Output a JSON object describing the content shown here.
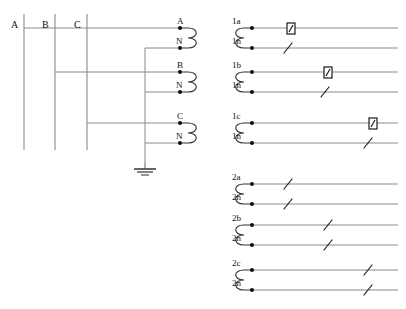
{
  "diagram": {
    "colors": {
      "line": "#8a8a8a",
      "dark_line": "#202020",
      "terminal_dot": "#101010",
      "text": "#101010",
      "background": "#ffffff"
    },
    "bus_labels": [
      {
        "name": "bus-label-a",
        "text": "A",
        "x": 12,
        "y": 28
      },
      {
        "name": "bus-label-b",
        "text": "B",
        "x": 43,
        "y": 28
      },
      {
        "name": "bus-label-c",
        "text": "C",
        "x": 74,
        "y": 28
      }
    ],
    "bus_bars": [
      {
        "name": "bus-bar-a",
        "phase": "A",
        "x": 24,
        "y_top": 14,
        "y_bottom": 150
      },
      {
        "name": "bus-bar-b",
        "phase": "B",
        "x": 55,
        "y_top": 14,
        "y_bottom": 150
      },
      {
        "name": "bus-bar-c",
        "phase": "C",
        "x": 87,
        "y_top": 14,
        "y_bottom": 150
      }
    ],
    "primary_taps": [
      {
        "name": "tap-a",
        "phase": "A",
        "from_x": 24,
        "y": 28,
        "to_x": 180
      },
      {
        "name": "tap-b",
        "phase": "B",
        "from_x": 55,
        "y": 72,
        "to_x": 180
      },
      {
        "name": "tap-c",
        "phase": "C",
        "from_x": 87,
        "y": 123,
        "to_x": 180
      }
    ],
    "neutral_bus": {
      "name": "neutral-bus",
      "x": 145,
      "y_top": 48,
      "y_bottom": 163,
      "taps": [
        {
          "name": "neutral-tap-1",
          "y": 48,
          "to_x": 180
        },
        {
          "name": "neutral-tap-2",
          "y": 92,
          "to_x": 180
        },
        {
          "name": "neutral-tap-3",
          "y": 143,
          "to_x": 180
        }
      ]
    },
    "ground": {
      "name": "ground-symbol",
      "x": 145,
      "y": 163,
      "label": "earth-ground"
    },
    "primary_windings": [
      {
        "name": "primary-winding-a",
        "x": 182,
        "y_top": 28,
        "y_bottom": 48
      },
      {
        "name": "primary-winding-b",
        "x": 182,
        "y_top": 72,
        "y_bottom": 92
      },
      {
        "name": "primary-winding-c",
        "x": 182,
        "y_top": 123,
        "y_bottom": 143
      }
    ],
    "primary_terminals": [
      {
        "name": "terminal-a",
        "label": "A",
        "x": 180,
        "y": 28
      },
      {
        "name": "terminal-n-1",
        "label": "N",
        "x": 180,
        "y": 48
      },
      {
        "name": "terminal-b",
        "label": "B",
        "x": 180,
        "y": 72
      },
      {
        "name": "terminal-n-2",
        "label": "N",
        "x": 180,
        "y": 92
      },
      {
        "name": "terminal-c",
        "label": "C",
        "x": 180,
        "y": 123
      },
      {
        "name": "terminal-n-3",
        "label": "N",
        "x": 180,
        "y": 143
      }
    ],
    "secondary_groups": [
      {
        "name": "secondary-group-1",
        "coils": [
          {
            "name": "secondary-coil-1a",
            "coil_x": 213,
            "y_top": 28,
            "y_bottom": 48,
            "terminals": [
              {
                "name": "terminal-1a",
                "label": "1a",
                "x": 252,
                "y": 28,
                "line_to_x": 398,
                "device": {
                  "type": "test-link-box",
                  "x": 290,
                  "name": "test-link-1a"
                }
              },
              {
                "name": "terminal-1n-1",
                "label": "1n",
                "x": 252,
                "y": 48,
                "line_to_x": 398,
                "device": {
                  "type": "slash",
                  "x": 288,
                  "name": "link-slash-1n-1"
                }
              }
            ]
          },
          {
            "name": "secondary-coil-1b",
            "coil_x": 213,
            "y_top": 72,
            "y_bottom": 92,
            "terminals": [
              {
                "name": "terminal-1b",
                "label": "1b",
                "x": 252,
                "y": 72,
                "line_to_x": 398,
                "device": {
                  "type": "test-link-box",
                  "x": 327,
                  "name": "test-link-1b"
                }
              },
              {
                "name": "terminal-1n-2",
                "label": "1n",
                "x": 252,
                "y": 92,
                "line_to_x": 398,
                "device": {
                  "type": "slash",
                  "x": 325,
                  "name": "link-slash-1n-2"
                }
              }
            ]
          },
          {
            "name": "secondary-coil-1c",
            "coil_x": 213,
            "y_top": 123,
            "y_bottom": 143,
            "terminals": [
              {
                "name": "terminal-1c",
                "label": "1c",
                "x": 252,
                "y": 123,
                "line_to_x": 398,
                "device": {
                  "type": "test-link-box",
                  "x": 372,
                  "name": "test-link-1c"
                }
              },
              {
                "name": "terminal-1n-3",
                "label": "1n",
                "x": 252,
                "y": 143,
                "line_to_x": 398,
                "device": {
                  "type": "slash",
                  "x": 368,
                  "name": "link-slash-1n-3"
                }
              }
            ]
          }
        ]
      },
      {
        "name": "secondary-group-2",
        "coils": [
          {
            "name": "secondary-coil-2a",
            "coil_x": 213,
            "y_top": 184,
            "y_bottom": 204,
            "terminals": [
              {
                "name": "terminal-2a",
                "label": "2a",
                "x": 252,
                "y": 184,
                "line_to_x": 398,
                "device": {
                  "type": "slash",
                  "x": 288,
                  "name": "link-slash-2a"
                }
              },
              {
                "name": "terminal-2n-1",
                "label": "2n",
                "x": 252,
                "y": 204,
                "line_to_x": 398,
                "device": {
                  "type": "slash",
                  "x": 288,
                  "name": "link-slash-2n-1"
                }
              }
            ]
          },
          {
            "name": "secondary-coil-2b",
            "coil_x": 213,
            "y_top": 225,
            "y_bottom": 245,
            "terminals": [
              {
                "name": "terminal-2b",
                "label": "2b",
                "x": 252,
                "y": 225,
                "line_to_x": 398,
                "device": {
                  "type": "slash",
                  "x": 328,
                  "name": "link-slash-2b"
                }
              },
              {
                "name": "terminal-2n-2",
                "label": "2n",
                "x": 252,
                "y": 245,
                "line_to_x": 398,
                "device": {
                  "type": "slash",
                  "x": 328,
                  "name": "link-slash-2n-2"
                }
              }
            ]
          },
          {
            "name": "secondary-coil-2c",
            "coil_x": 213,
            "y_top": 270,
            "y_bottom": 290,
            "terminals": [
              {
                "name": "terminal-2c",
                "label": "2c",
                "x": 252,
                "y": 270,
                "line_to_x": 398,
                "device": {
                  "type": "slash",
                  "x": 368,
                  "name": "link-slash-2c"
                }
              },
              {
                "name": "terminal-2n-3",
                "label": "2n",
                "x": 252,
                "y": 290,
                "line_to_x": 398,
                "device": {
                  "type": "slash",
                  "x": 368,
                  "name": "link-slash-2n-3"
                }
              }
            ]
          }
        ]
      }
    ]
  }
}
